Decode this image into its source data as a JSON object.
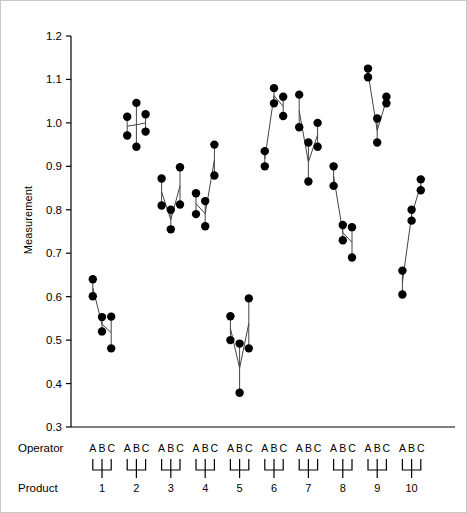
{
  "chart_data": {
    "type": "scatter",
    "title": "",
    "xlabel": "",
    "ylabel": "Measurement",
    "ylim": [
      0.3,
      1.2
    ],
    "yticks": [
      "0.3",
      "0.4",
      "0.5",
      "0.6",
      "0.7",
      "0.8",
      "0.9",
      "1.0",
      "1.1",
      "1.2"
    ],
    "ytick_values": [
      0.3,
      0.4,
      0.5,
      0.6,
      0.7,
      0.8,
      0.9,
      1.0,
      1.1,
      1.2
    ],
    "grid": false,
    "legend_position": "none",
    "operators": [
      "A",
      "B",
      "C"
    ],
    "axis_row_labels": {
      "operator": "Operator",
      "product": "Product"
    },
    "products": [
      "1",
      "2",
      "3",
      "4",
      "5",
      "6",
      "7",
      "8",
      "9",
      "10"
    ],
    "groups": [
      {
        "product": "1",
        "operators": [
          {
            "operator": "A",
            "values": [
              0.64,
              0.601
            ]
          },
          {
            "operator": "B",
            "values": [
              0.553,
              0.52
            ]
          },
          {
            "operator": "C",
            "values": [
              0.554,
              0.481
            ]
          }
        ]
      },
      {
        "product": "2",
        "operators": [
          {
            "operator": "A",
            "values": [
              1.014,
              0.971
            ]
          },
          {
            "operator": "B",
            "values": [
              1.046,
              0.945
            ]
          },
          {
            "operator": "C",
            "values": [
              1.02,
              0.98
            ]
          }
        ]
      },
      {
        "product": "3",
        "operators": [
          {
            "operator": "A",
            "values": [
              0.872,
              0.81
            ]
          },
          {
            "operator": "B",
            "values": [
              0.8,
              0.755
            ]
          },
          {
            "operator": "C",
            "values": [
              0.898,
              0.812
            ]
          }
        ]
      },
      {
        "product": "4",
        "operators": [
          {
            "operator": "A",
            "values": [
              0.838,
              0.79
            ]
          },
          {
            "operator": "B",
            "values": [
              0.82,
              0.762
            ]
          },
          {
            "operator": "C",
            "values": [
              0.95,
              0.879
            ]
          }
        ]
      },
      {
        "product": "5",
        "operators": [
          {
            "operator": "A",
            "values": [
              0.555,
              0.5
            ]
          },
          {
            "operator": "B",
            "values": [
              0.492,
              0.379
            ]
          },
          {
            "operator": "C",
            "values": [
              0.596,
              0.481
            ]
          }
        ]
      },
      {
        "product": "6",
        "operators": [
          {
            "operator": "A",
            "values": [
              0.935,
              0.9
            ]
          },
          {
            "operator": "B",
            "values": [
              1.08,
              1.045
            ]
          },
          {
            "operator": "C",
            "values": [
              1.06,
              1.016
            ]
          }
        ]
      },
      {
        "product": "7",
        "operators": [
          {
            "operator": "A",
            "values": [
              1.065,
              0.99
            ]
          },
          {
            "operator": "B",
            "values": [
              0.955,
              0.865
            ]
          },
          {
            "operator": "C",
            "values": [
              1.0,
              0.945
            ]
          }
        ]
      },
      {
        "product": "8",
        "operators": [
          {
            "operator": "A",
            "values": [
              0.9,
              0.855
            ]
          },
          {
            "operator": "B",
            "values": [
              0.765,
              0.73
            ]
          },
          {
            "operator": "C",
            "values": [
              0.76,
              0.69
            ]
          }
        ]
      },
      {
        "product": "9",
        "operators": [
          {
            "operator": "A",
            "values": [
              1.125,
              1.105
            ]
          },
          {
            "operator": "B",
            "values": [
              1.01,
              0.955
            ]
          },
          {
            "operator": "C",
            "values": [
              1.06,
              1.045
            ]
          }
        ]
      },
      {
        "product": "10",
        "operators": [
          {
            "operator": "A",
            "values": [
              0.66,
              0.605
            ]
          },
          {
            "operator": "B",
            "values": [
              0.8,
              0.775
            ]
          },
          {
            "operator": "C",
            "values": [
              0.87,
              0.845
            ]
          }
        ]
      }
    ],
    "style": {
      "marker_color": "#000000",
      "marker_size": 4.2,
      "line_color": "#444444",
      "axis_color": "#000000",
      "background": "#ffffff"
    }
  }
}
